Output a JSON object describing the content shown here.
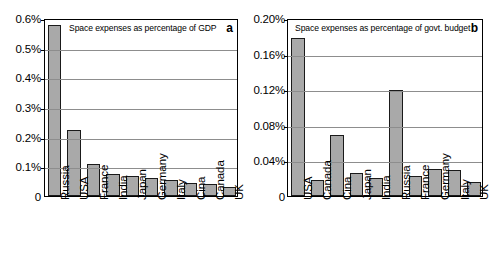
{
  "figure": {
    "background": "#ffffff",
    "bar_fill": "#a9a9a9",
    "bar_stroke": "#1a1a1a",
    "grid_color": "#8d8d8d"
  },
  "panels": [
    {
      "letter": "a",
      "title": "Space expenses as percentage of GDP",
      "zero_label": "0",
      "yticks": [
        "0.6%",
        "0.5%",
        "0.4%",
        "0.3%",
        "0.2%",
        "0.1%",
        "0"
      ],
      "categories": [
        "Russia",
        "USA",
        "France",
        "India",
        "Japan",
        "Germany",
        "Italy",
        "Cina",
        "Canada",
        "UK"
      ]
    },
    {
      "letter": "b",
      "title": "Space expenses as percentage of govt. budget",
      "zero_label": "0",
      "yticks": [
        "0.20%",
        "0.16%",
        "0.12%",
        "0.08%",
        "0.04%",
        "0"
      ],
      "categories": [
        "USA",
        "Canada",
        "Cina",
        "Japan",
        "India",
        "Russia",
        "France",
        "Germany",
        "Italy",
        "UK"
      ]
    }
  ],
  "chart_data": [
    {
      "type": "bar",
      "panel": "a",
      "title": "Space expenses as percentage of GDP",
      "xlabel": "",
      "ylabel": "",
      "ylim": [
        0,
        0.6
      ],
      "yticks": [
        0,
        0.1,
        0.2,
        0.3,
        0.4,
        0.5,
        0.6
      ],
      "ytick_labels": [
        "0",
        "0.1%",
        "0.2%",
        "0.3%",
        "0.4%",
        "0.5%",
        "0.6%"
      ],
      "unit": "percent",
      "grid": true,
      "legend": false,
      "categories": [
        "Russia",
        "USA",
        "France",
        "India",
        "Japan",
        "Germany",
        "Italy",
        "Cina",
        "Canada",
        "UK"
      ],
      "values": [
        0.577,
        0.222,
        0.108,
        0.073,
        0.066,
        0.06,
        0.054,
        0.045,
        0.04,
        0.031
      ]
    },
    {
      "type": "bar",
      "panel": "b",
      "title": "Space expenses as percentage of govt. budget",
      "xlabel": "",
      "ylabel": "",
      "ylim": [
        0,
        0.2
      ],
      "yticks": [
        0,
        0.04,
        0.08,
        0.12,
        0.16,
        0.2
      ],
      "ytick_labels": [
        "0",
        "0.04%",
        "0.08%",
        "0.12%",
        "0.16%",
        "0.20%"
      ],
      "unit": "percent",
      "grid": true,
      "legend": false,
      "categories": [
        "USA",
        "Canada",
        "Cina",
        "Japan",
        "India",
        "Russia",
        "France",
        "Germany",
        "Italy",
        "UK"
      ],
      "values": [
        0.178,
        0.018,
        0.068,
        0.026,
        0.02,
        0.119,
        0.023,
        0.03,
        0.029,
        0.016
      ]
    }
  ]
}
